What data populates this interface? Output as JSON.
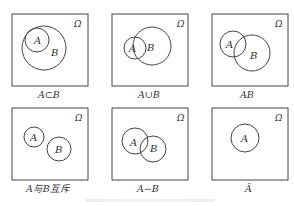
{
  "figure": {
    "universe_symbol": "Ω",
    "panels": [
      {
        "id": "subset",
        "caption": "A⊂B",
        "labels": {
          "a": "A",
          "b": "B"
        }
      },
      {
        "id": "union",
        "caption": "A∪B",
        "labels": {
          "a": "A",
          "b": "B"
        }
      },
      {
        "id": "intersection",
        "caption": "AB",
        "labels": {
          "a": "A",
          "b": "B"
        }
      },
      {
        "id": "mutually-exclusive",
        "caption": "A与B互斥",
        "labels": {
          "a": "A",
          "b": "B"
        }
      },
      {
        "id": "difference",
        "caption": "A−B",
        "labels": {
          "a": "A",
          "b": "B"
        }
      },
      {
        "id": "complement",
        "caption": "Ā",
        "labels": {
          "a": "A"
        }
      }
    ]
  }
}
